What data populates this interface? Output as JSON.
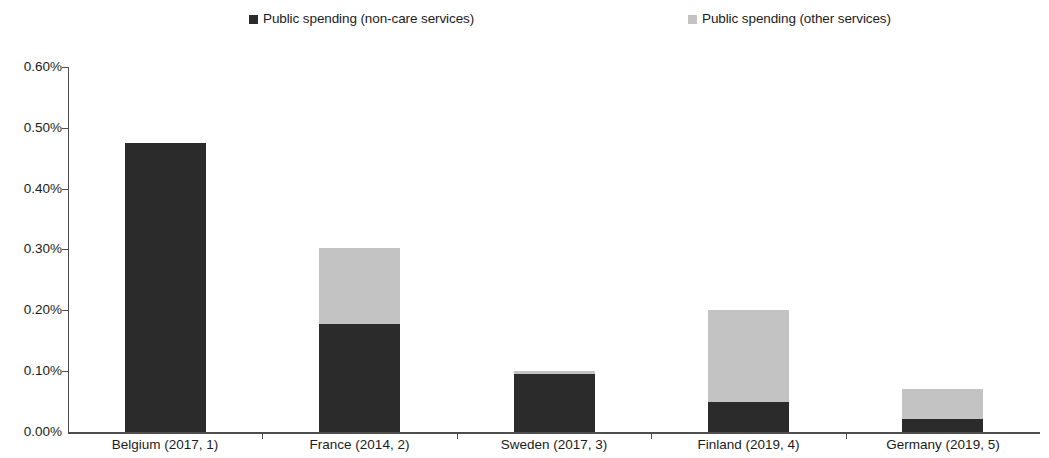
{
  "chart_data": {
    "type": "bar",
    "stacked": true,
    "title": "",
    "subtitle": "",
    "xlabel": "",
    "ylabel": "",
    "grid": false,
    "legend_position": "top",
    "ylim": [
      0,
      0.6
    ],
    "y_tick_labels": [
      "0.60%",
      "0.50%",
      "0.40%",
      "0.30%",
      "0.20%",
      "0.10%",
      "0.00%"
    ],
    "y_tick_values": [
      0.6,
      0.5,
      0.4,
      0.3,
      0.2,
      0.1,
      0.0
    ],
    "categories": [
      "Belgium (2017, 1)",
      "France (2014, 2)",
      "Sweden (2017, 3)",
      "Finland (2019, 4)",
      "Germany (2019, 5)"
    ],
    "series": [
      {
        "name": "Public spending (non-care services)",
        "color": "#2b2b2b",
        "values": [
          0.475,
          0.178,
          0.095,
          0.05,
          0.022
        ]
      },
      {
        "name": "Public spending (other services)",
        "color": "#c3c3c3",
        "values": [
          0.0,
          0.124,
          0.005,
          0.15,
          0.048
        ]
      }
    ],
    "totals": [
      0.475,
      0.302,
      0.1,
      0.2,
      0.07
    ]
  },
  "legend": {
    "entries": [
      {
        "label": "Public spending (non-care services)",
        "swatch_name": "legend-swatch-dark"
      },
      {
        "label": "Public spending (other services)",
        "swatch_name": "legend-swatch-light"
      }
    ]
  },
  "axes": {
    "y": {
      "labels": [
        "0.60%",
        "0.50%",
        "0.40%",
        "0.30%",
        "0.20%",
        "0.10%",
        "0.00%"
      ]
    },
    "x": {
      "labels": [
        "Belgium (2017, 1)",
        "France (2014, 2)",
        "Sweden (2017, 3)",
        "Finland (2019, 4)",
        "Germany (2019, 5)"
      ]
    }
  }
}
